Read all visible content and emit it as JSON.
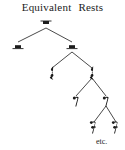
{
  "diagram": {
    "title_part1": "Equivalent",
    "title_part2": "Rests",
    "title_full": "Equivalent Rests",
    "type": "binary-tree",
    "footnote": "etc.",
    "ink_color": "#1c1c1c",
    "background_color": "#ffffff",
    "levels": [
      {
        "index": 0,
        "rest_type": "whole-rest",
        "duration": "1",
        "count": 1
      },
      {
        "index": 1,
        "rest_type": "half-rest",
        "duration": "1/2",
        "count": 2
      },
      {
        "index": 2,
        "rest_type": "quarter-rest",
        "duration": "1/4",
        "count": 2
      },
      {
        "index": 3,
        "rest_type": "eighth-rest",
        "duration": "1/8",
        "count": 2
      },
      {
        "index": 4,
        "rest_type": "sixteenth-rest",
        "duration": "1/16",
        "count": 2
      }
    ],
    "nodes": [
      {
        "id": "n0",
        "rest_type": "whole-rest",
        "level": 0,
        "x": 46,
        "y": 23
      },
      {
        "id": "n1a",
        "rest_type": "half-rest",
        "level": 1,
        "x": 18,
        "y": 47
      },
      {
        "id": "n1b",
        "rest_type": "half-rest",
        "level": 1,
        "x": 72,
        "y": 47
      },
      {
        "id": "n2a",
        "rest_type": "quarter-rest",
        "level": 2,
        "x": 52,
        "y": 73
      },
      {
        "id": "n2b",
        "rest_type": "quarter-rest",
        "level": 2,
        "x": 92,
        "y": 73
      },
      {
        "id": "n3a",
        "rest_type": "eighth-rest",
        "level": 3,
        "x": 76,
        "y": 101
      },
      {
        "id": "n3b",
        "rest_type": "eighth-rest",
        "level": 3,
        "x": 106,
        "y": 101
      },
      {
        "id": "n4a",
        "rest_type": "sixteenth-rest",
        "level": 4,
        "x": 94,
        "y": 127
      },
      {
        "id": "n4b",
        "rest_type": "sixteenth-rest",
        "level": 4,
        "x": 116,
        "y": 127
      }
    ],
    "edges": [
      {
        "from": "n0",
        "to": "n1a"
      },
      {
        "from": "n0",
        "to": "n1b"
      },
      {
        "from": "n1b",
        "to": "n2a"
      },
      {
        "from": "n1b",
        "to": "n2b"
      },
      {
        "from": "n2b",
        "to": "n3a"
      },
      {
        "from": "n2b",
        "to": "n3b"
      },
      {
        "from": "n3b",
        "to": "n4a"
      },
      {
        "from": "n3b",
        "to": "n4b"
      }
    ]
  }
}
